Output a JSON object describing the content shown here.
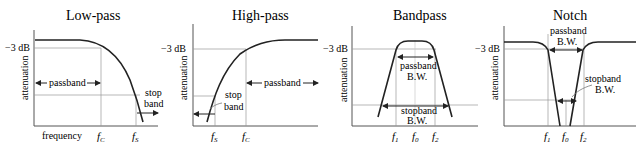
{
  "panels": [
    {
      "title": "Low-pass",
      "ylabel": "attenuation",
      "xlabel": "frequency",
      "level_label": "−3 dB",
      "annotations": [
        "passband",
        "stop",
        "band"
      ],
      "ticks": [
        {
          "f": "f",
          "sub": "C"
        },
        {
          "f": "f",
          "sub": "S"
        }
      ]
    },
    {
      "title": "High-pass",
      "ylabel": "attenuation",
      "level_label": "−3 dB",
      "annotations": [
        "passband",
        "stop",
        "band"
      ],
      "ticks": [
        {
          "f": "f",
          "sub": "S"
        },
        {
          "f": "f",
          "sub": "C"
        }
      ]
    },
    {
      "title": "Bandpass",
      "ylabel": "attenuation",
      "level_label": "−3 dB",
      "annotations": [
        "passband",
        "B.W.",
        "stopband",
        "B.W."
      ],
      "ticks": [
        {
          "f": "f",
          "sub": "1"
        },
        {
          "f": "f",
          "sub": "0"
        },
        {
          "f": "f",
          "sub": "2"
        }
      ]
    },
    {
      "title": "Notch",
      "ylabel": "attenuation",
      "level_label": "−3 dB",
      "annotations": [
        "passband",
        "B.W.",
        "stopband",
        "B.W."
      ],
      "ticks": [
        {
          "f": "f",
          "sub": "1"
        },
        {
          "f": "f",
          "sub": "0"
        },
        {
          "f": "f",
          "sub": "2"
        }
      ]
    }
  ],
  "colors": {
    "curve": "#222222",
    "grid": "#9a9a9a",
    "axis": "#555555"
  }
}
